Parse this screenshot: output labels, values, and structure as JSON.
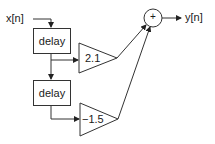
{
  "diagram": {
    "type": "signal-flow block diagram",
    "input_label": "x[n]",
    "output_label": "y[n]",
    "blocks": [
      {
        "id": "delay1",
        "kind": "delay",
        "label": "delay"
      },
      {
        "id": "delay2",
        "kind": "delay",
        "label": "delay"
      },
      {
        "id": "gain1",
        "kind": "gain",
        "label": "2.1"
      },
      {
        "id": "gain2",
        "kind": "gain",
        "label": "−1.5"
      },
      {
        "id": "sum",
        "kind": "adder",
        "label": "+"
      }
    ],
    "connections": [
      {
        "from": "x[n]",
        "to": "delay1"
      },
      {
        "from": "delay1",
        "to": "gain1"
      },
      {
        "from": "delay1",
        "to": "delay2"
      },
      {
        "from": "delay2",
        "to": "gain2"
      },
      {
        "from": "gain1",
        "to": "sum"
      },
      {
        "from": "gain2",
        "to": "sum"
      },
      {
        "from": "sum",
        "to": "y[n]"
      }
    ]
  }
}
